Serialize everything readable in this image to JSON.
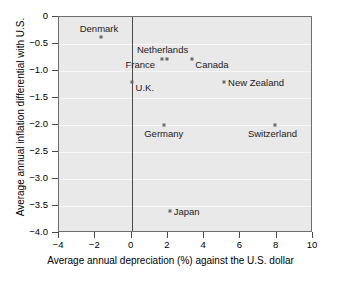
{
  "chart_data": {
    "type": "scatter",
    "title": "",
    "xlabel": "Average annual depreciation (%) against the U.S. dollar",
    "ylabel": "Average annual inflation differential with U.S.",
    "xlim": [
      -4,
      10
    ],
    "ylim": [
      -4.0,
      0.0
    ],
    "xticks": [
      -4,
      -2,
      0,
      2,
      4,
      6,
      8,
      10
    ],
    "xtick_labels": [
      "−4",
      "−2",
      "0",
      "2",
      "4",
      "6",
      "8",
      "10"
    ],
    "yticks": [
      0,
      -0.5,
      -1.0,
      -1.5,
      -2.0,
      -2.5,
      -3.0,
      -3.5,
      -4.0
    ],
    "ytick_labels": [
      "0",
      "−0.5",
      "−1.0",
      "−1.5",
      "−2.0",
      "−2.5",
      "−3.0",
      "−3.5",
      "−4.0"
    ],
    "grid": true,
    "grid_axis": "y",
    "legend": "none",
    "reference_lines": [
      {
        "axis": "x",
        "value": 0
      }
    ],
    "marker_color": "#6a6a6a",
    "plot_background": "#e9e9e9",
    "gridline_color": "#f7f7f7",
    "points": [
      {
        "label": "Denmark",
        "x": -1.7,
        "y": -0.37,
        "label_dx": -21,
        "label_dy": -13
      },
      {
        "label": "Netherlands",
        "x": 1.95,
        "y": -0.78,
        "label_dx": -30,
        "label_dy": -14
      },
      {
        "label": "France",
        "x": 1.65,
        "y": -0.78,
        "label_dx": -36,
        "label_dy": 1
      },
      {
        "label": "Canada",
        "x": 3.35,
        "y": -0.78,
        "label_dx": 3,
        "label_dy": 1
      },
      {
        "label": "U.K.",
        "x": 0.0,
        "y": -1.2,
        "label_dx": 4,
        "label_dy": 1
      },
      {
        "label": "New Zealand",
        "x": 5.1,
        "y": -1.2,
        "label_dx": 4,
        "label_dy": -4
      },
      {
        "label": "Germany",
        "x": 1.8,
        "y": -2.0,
        "label_dx": -20,
        "label_dy": 4
      },
      {
        "label": "Switzerland",
        "x": 7.9,
        "y": -2.0,
        "label_dx": -27,
        "label_dy": 4
      },
      {
        "label": "Japan",
        "x": 2.1,
        "y": -3.6,
        "label_dx": 4,
        "label_dy": -4
      }
    ]
  }
}
